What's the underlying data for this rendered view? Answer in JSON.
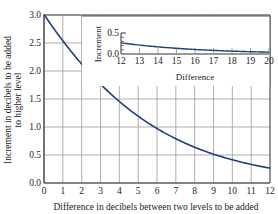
{
  "chart_data": [
    {
      "type": "line",
      "role": "main",
      "title": "",
      "xlabel": "Difference in decibels between two levels to be added",
      "ylabel_line1": "Increment in decibels to be added",
      "ylabel_line2": "to higher level",
      "xlim": [
        0,
        12
      ],
      "ylim": [
        0,
        3
      ],
      "grid": true,
      "x_ticks": [
        "0",
        "1",
        "2",
        "3",
        "4",
        "5",
        "6",
        "7",
        "8",
        "9",
        "10",
        "11",
        "12"
      ],
      "y_ticks": [
        "0.0",
        "0.5",
        "1.0",
        "1.5",
        "2.0",
        "2.5",
        "3.0"
      ],
      "x": [
        0,
        1,
        2,
        3,
        4,
        5,
        6,
        7,
        8,
        9,
        10,
        11,
        12
      ],
      "values": [
        3.01,
        2.54,
        2.12,
        1.76,
        1.46,
        1.19,
        0.97,
        0.79,
        0.64,
        0.51,
        0.41,
        0.33,
        0.27
      ],
      "line_color": "#1f3f7a"
    },
    {
      "type": "line",
      "role": "inset",
      "xlabel": "Difference",
      "ylabel": "Increment",
      "xlim": [
        12,
        20
      ],
      "ylim": [
        0,
        0.5
      ],
      "x_ticks": [
        "12",
        "13",
        "14",
        "15",
        "16",
        "17",
        "18",
        "19",
        "20"
      ],
      "y_ticks": [
        "0.0",
        "0.5"
      ],
      "x": [
        12,
        13,
        14,
        15,
        16,
        17,
        18,
        19,
        20
      ],
      "values": [
        0.27,
        0.21,
        0.17,
        0.14,
        0.11,
        0.09,
        0.07,
        0.05,
        0.04
      ],
      "line_color": "#1f3f7a"
    }
  ]
}
